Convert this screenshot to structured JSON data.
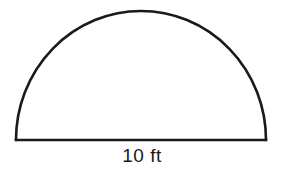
{
  "diagram": {
    "shape": "semicircle",
    "base_label": "10 ft",
    "stroke_color": "#1a1a1a",
    "background_color": "#ffffff",
    "geometry": {
      "base_left_x": 16,
      "base_right_x": 266,
      "base_y": 140,
      "top_y": 11
    }
  }
}
